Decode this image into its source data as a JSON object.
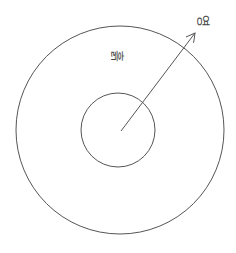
{
  "diagram": {
    "labels": {
      "region": "흙",
      "pointer": "영"
    },
    "colors": {
      "stroke": "#555555",
      "background": "#ffffff"
    },
    "shapes": {
      "outer_circle": {
        "cx": 120,
        "cy": 130,
        "r": 104
      },
      "inner_circle": {
        "cx": 118,
        "cy": 130,
        "r": 37
      },
      "arrow": {
        "x1": 121,
        "y1": 131,
        "x2": 195,
        "y2": 33
      }
    }
  }
}
